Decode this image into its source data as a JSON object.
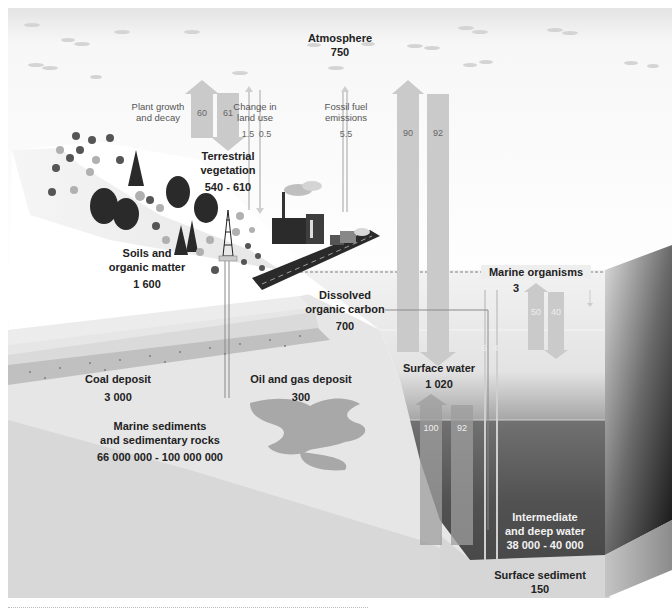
{
  "diagram": {
    "reservoirs": [
      {
        "id": "atmosphere",
        "name": "Atmosphere",
        "value": "750"
      },
      {
        "id": "terrestrial-vegetation",
        "name": "Terrestrial vegetation",
        "name_line1": "Terrestrial",
        "name_line2": "vegetation",
        "value": "540 - 610"
      },
      {
        "id": "soils",
        "name": "Soils and organic matter",
        "name_line1": "Soils and",
        "name_line2": "organic matter",
        "value": "1 600"
      },
      {
        "id": "marine-organisms",
        "name": "Marine organisms",
        "value": "3"
      },
      {
        "id": "dissolved-organic-carbon",
        "name": "Dissolved organic carbon",
        "name_line1": "Dissolved",
        "name_line2": "organic carbon",
        "value": "700"
      },
      {
        "id": "surface-water",
        "name": "Surface water",
        "value": "1 020"
      },
      {
        "id": "coal",
        "name": "Coal deposit",
        "value": "3 000"
      },
      {
        "id": "oil-gas",
        "name": "Oil and gas deposit",
        "value": "300"
      },
      {
        "id": "marine-sediments",
        "name": "Marine sediments and sedimentary rocks",
        "name_line1": "Marine sediments",
        "name_line2": "and sedimentary rocks",
        "value": "66 000 000 - 100 000 000"
      },
      {
        "id": "deep-water",
        "name": "Intermediate and deep water",
        "name_line1": "Intermediate",
        "name_line2": "and deep water",
        "value": "38 000 - 40 000"
      },
      {
        "id": "surface-sediment",
        "name": "Surface sediment",
        "value": "150"
      }
    ],
    "flux_labels": {
      "plant_growth_line1": "Plant growth",
      "plant_growth_line2": "and decay",
      "land_use_line1": "Change in",
      "land_use_line2": "land use",
      "fossil_line1": "Fossil fuel",
      "fossil_line2": "emissions"
    },
    "fluxes": {
      "plant_up": "60",
      "plant_down": "61",
      "land_use_a": "1.5",
      "land_use_b": "0.5",
      "fossil": "5.5",
      "ocean_up": "90",
      "ocean_down": "92",
      "marine_up": "50",
      "marine_down": "40",
      "deep_up": "100",
      "deep_down": "92",
      "doc_a": "6",
      "doc_b": "4"
    },
    "colors": {
      "arrow": "#c8c8c8",
      "arrow_dark": "#8a8a8a",
      "ocean_top": "#e6e6e6",
      "ocean_deep": "#3a3a3a",
      "sediment": "#cfcfcf",
      "rock": "#e2e2e2",
      "coal_band": "#b8b8b8",
      "oil": "#a9a9a9"
    }
  }
}
